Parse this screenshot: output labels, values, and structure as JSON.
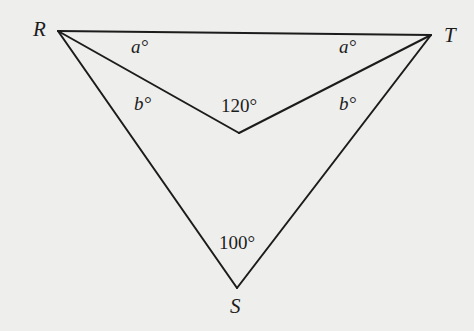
{
  "diagram": {
    "type": "geometry-figure",
    "vertices": {
      "R": {
        "label": "R",
        "x": 58,
        "y": 31
      },
      "T": {
        "label": "T",
        "x": 431,
        "y": 35
      },
      "S": {
        "label": "S",
        "x": 237,
        "y": 288
      },
      "P": {
        "label": "",
        "x": 239,
        "y": 133
      }
    },
    "segments": [
      [
        "R",
        "T"
      ],
      [
        "R",
        "S"
      ],
      [
        "T",
        "S"
      ],
      [
        "R",
        "P"
      ],
      [
        "T",
        "P"
      ]
    ],
    "angle_labels": {
      "a_left": "a°",
      "a_right": "a°",
      "b_left": "b°",
      "b_right": "b°",
      "inner": "120°",
      "bottom": "100°"
    },
    "colors": {
      "line": "#1c1c1c",
      "background": "#eeeeec"
    }
  }
}
